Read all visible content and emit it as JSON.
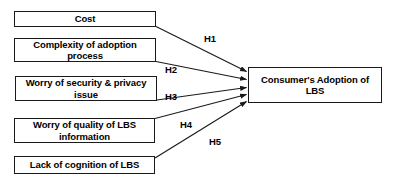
{
  "diagram": {
    "type": "research-model",
    "colors": {
      "box_border": "#1a1a1a",
      "box_fill": "#ffffff",
      "arrow": "#1a1a1a",
      "text": "#000000",
      "background": "#ffffff"
    },
    "antecedent_nodes": [
      {
        "id": "cost",
        "label": "Cost"
      },
      {
        "id": "complexity",
        "label": "Complexity of adoption process"
      },
      {
        "id": "security",
        "label": "Worry of security & privacy issue"
      },
      {
        "id": "quality",
        "label": "Worry of quality of LBS information"
      },
      {
        "id": "cognition",
        "label": "Lack of cognition of LBS"
      }
    ],
    "outcome_node": {
      "id": "adoption",
      "label": "Consumer's Adoption of LBS"
    },
    "hypotheses": [
      {
        "id": "h1",
        "label": "H1",
        "from": "cost",
        "to": "adoption"
      },
      {
        "id": "h2",
        "label": "H2",
        "from": "complexity",
        "to": "adoption"
      },
      {
        "id": "h3",
        "label": "H3",
        "from": "security",
        "to": "adoption"
      },
      {
        "id": "h4",
        "label": "H4",
        "from": "quality",
        "to": "adoption"
      },
      {
        "id": "h5",
        "label": "H5",
        "from": "cognition",
        "to": "adoption"
      }
    ]
  }
}
